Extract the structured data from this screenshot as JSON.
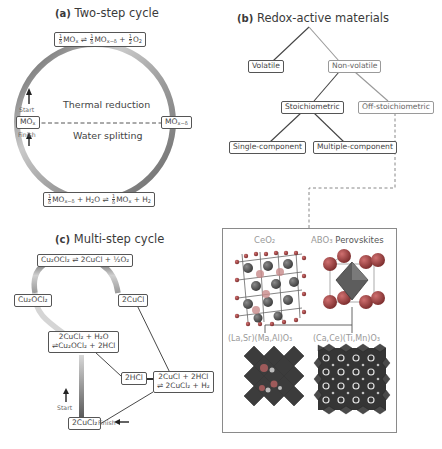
{
  "panel_a": {
    "label": "(a)",
    "title": "Two-step cycle",
    "top_equation": {
      "lhs_coef": "1/δ",
      "lhs": "MOx",
      "arrow": "⇌",
      "rhs_coef": "1/δ",
      "rhs": "MOx−δ",
      "plus": "+",
      "o2_coef": "1/2",
      "o2": "O2"
    },
    "bottom_equation": {
      "lhs_coef": "1/δ",
      "lhs": "MOx−δ",
      "plus1": "+",
      "h2o": "H2O",
      "arrow": "⇌",
      "rhs_coef": "1/δ",
      "rhs": "MOx",
      "plus2": "+",
      "h2": "H2"
    },
    "left_node": "MOx",
    "right_node": "MOx−δ",
    "upper_label": "Thermal reduction",
    "lower_label": "Water splitting",
    "start_label": "Start",
    "finish_label": "Finish"
  },
  "panel_b": {
    "label": "(b)",
    "title": "Redox-active materials",
    "nodes": {
      "volatile": "Volatile",
      "non_volatile": "Non-volatile",
      "stoichiometric": "Stoichiometric",
      "off_stoichiometric": "Off-stoichiometric",
      "single_component": "Single-component",
      "multiple_component": "Multiple-component"
    },
    "materials": {
      "ceo2": "CeO₂",
      "abo3_prefix": "ABO₃",
      "abo3_suffix": "Perovskites",
      "lasr": "(La,Sr)(Ma,Al)O₃",
      "cace": "(Ca,Ce)(Ti,Mn)O₃"
    }
  },
  "panel_c": {
    "label": "(c)",
    "title": "Multi-step cycle",
    "top_equation": "Cu₂OCl₂ ⇌ 2CuCl + ½O₂",
    "left_node": "Cu₂OCl₂",
    "right_node": "2CuCl",
    "hydrolysis_line1": "2CuCl₂ + H₂O",
    "hydrolysis_line2": "⇌Cu₂OCl₂ + 2HCl",
    "hcl_node": "2HCl",
    "electrolysis_line1": "2CuCl + 2HCl",
    "electrolysis_line2": "⇌ 2CuCl₂ + H₂",
    "start_node": "2CuCl₂",
    "start_label": "Start",
    "finish_label": "Finish"
  },
  "colors": {
    "ring_dark": "#5a5a5a",
    "ring_light": "#c8c8c8",
    "box_border": "#555555",
    "frame_border": "#8a8a8a",
    "atom_red": "#a84040",
    "atom_grey": "#7a7a7a",
    "polyhedra_dark": "#3a3a3a"
  }
}
